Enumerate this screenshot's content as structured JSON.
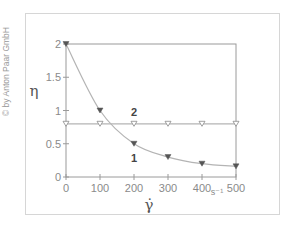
{
  "copyright": "© by Anton Paar GmbH",
  "chart_data": {
    "type": "line",
    "title": "",
    "xlabel": "γ̇",
    "xunit": "s-1",
    "ylabel": "η",
    "xlim": [
      0,
      500
    ],
    "ylim": [
      0,
      2
    ],
    "xticks": [
      0,
      100,
      200,
      300,
      400,
      500
    ],
    "xtick_labels": [
      "0",
      "100",
      "200",
      "300",
      "400",
      "500"
    ],
    "yticks": [
      0,
      0.5,
      1,
      1.5,
      2
    ],
    "ytick_labels": [
      "0",
      "0.5",
      "1",
      "1.5",
      "2"
    ],
    "grid": false,
    "x": [
      0,
      100,
      200,
      300,
      400,
      500
    ],
    "series": [
      {
        "name": "1",
        "marker": "filled-down-triangle",
        "values": [
          2.0,
          1.0,
          0.5,
          0.3,
          0.2,
          0.16
        ]
      },
      {
        "name": "2",
        "marker": "open-down-triangle",
        "values": [
          0.8,
          0.8,
          0.8,
          0.8,
          0.8,
          0.8
        ]
      }
    ],
    "annotations": [
      {
        "text": "1",
        "x": 200,
        "y": 0.28
      },
      {
        "text": "2",
        "x": 200,
        "y": 0.98
      }
    ]
  },
  "colors": {
    "line": "#b4b4b4",
    "marker": "#555555",
    "axis": "#9a9a9a"
  }
}
